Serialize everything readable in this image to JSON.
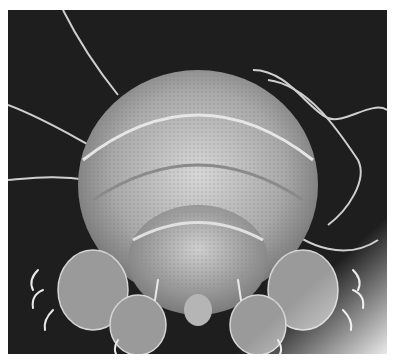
{
  "image": {
    "subject": "scanning electron micrograph of a tardigrade (water bear)",
    "style": "grayscale",
    "background_color": "#1c1c1c",
    "subject_color": "#c8c8c8",
    "border_color": "#ffffff"
  }
}
